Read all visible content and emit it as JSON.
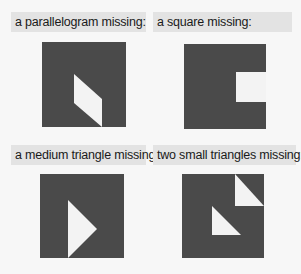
{
  "panels": [
    {
      "label": "a parallelogram missing:",
      "shape": "parallelogram"
    },
    {
      "label": "a square missing:",
      "shape": "square"
    },
    {
      "label": "a medium triangle missing:",
      "shape": "medium-triangle"
    },
    {
      "label": "two small triangles missing:",
      "shape": "two-small-triangles"
    }
  ],
  "colors": {
    "piece": "#4a4a4a",
    "hole": "#f3f3f3",
    "label_bg": "#e3e3e3"
  }
}
